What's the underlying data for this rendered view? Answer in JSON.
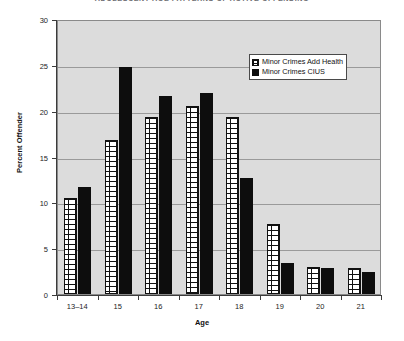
{
  "chart_data": {
    "type": "bar",
    "title": "ADOLESCENT AGE PATTERNS OF ACTIVE OFFENDING",
    "xlabel": "Age",
    "ylabel": "Percent Offender",
    "categories": [
      "13–14",
      "15",
      "16",
      "17",
      "18",
      "19",
      "20",
      "21"
    ],
    "series": [
      {
        "name": "Minor Crimes Add Health",
        "values": [
          10.5,
          16.8,
          19.3,
          20.5,
          19.3,
          7.6,
          2.9,
          2.8
        ]
      },
      {
        "name": "Minor Crimes CIUS",
        "values": [
          11.7,
          24.8,
          21.6,
          21.9,
          12.7,
          3.4,
          2.8,
          2.4
        ]
      }
    ],
    "ylim": [
      0,
      30
    ],
    "yticks": [
      0,
      5,
      10,
      15,
      20,
      25,
      30
    ],
    "ytick_labels": [
      "0",
      "5",
      "10",
      "15",
      "20",
      "25",
      "30"
    ],
    "grid": true,
    "legend_position": "top-right",
    "plot_background": "#DCDCDC",
    "series_colors": [
      "#FFFFFF",
      "#0D0D0D"
    ]
  }
}
